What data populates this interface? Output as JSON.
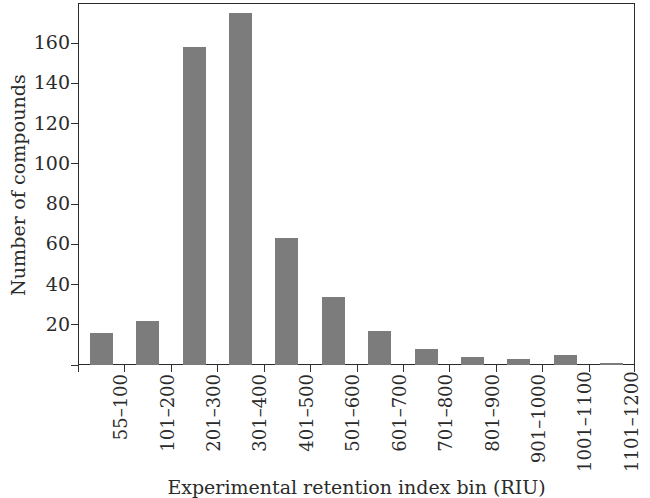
{
  "chart_data": {
    "type": "bar",
    "title": "",
    "xlabel": "Experimental retention index bin (RIU)",
    "ylabel": "Number of compounds",
    "categories": [
      "55–100",
      "101–200",
      "201–300",
      "301–400",
      "401–500",
      "501–600",
      "601–700",
      "701–800",
      "801–900",
      "901–1000",
      "1001–1100",
      "1101–1200"
    ],
    "values": [
      16,
      22,
      158,
      175,
      63,
      34,
      17,
      8,
      4,
      3,
      5,
      1
    ],
    "ylim": [
      0,
      180
    ],
    "yticks": [
      0,
      20,
      40,
      60,
      80,
      100,
      120,
      140,
      160
    ],
    "ytick_labels": [
      "",
      "20",
      "40",
      "60",
      "80",
      "100",
      "120",
      "140",
      "160"
    ],
    "grid": false,
    "legend": "none",
    "bar_color": "#7c7c7c",
    "axis_color": "#2a2a2a",
    "background": "#ffffff"
  }
}
